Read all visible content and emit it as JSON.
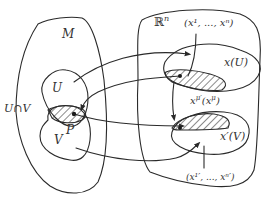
{
  "diagram": {
    "labels": {
      "manifold": "M",
      "chart_u": "U",
      "chart_v": "V",
      "intersection": "U∩V",
      "point": "P",
      "euclidean_space": "ℝ",
      "euclidean_space_exp": "n",
      "coords_top": "(x¹, ..., xⁿ)",
      "image_u": "x(U)",
      "transition": "x",
      "transition_sup": "μ′",
      "transition_arg": "(x",
      "transition_arg_sup": "μ",
      "transition_close": ")",
      "image_v": "x′(V)",
      "coords_bottom": "(x¹′, ..., xⁿ′)"
    },
    "colors": {
      "line": "#2a2a2a",
      "text": "#333333",
      "background": "#ffffff"
    },
    "arrows": [
      {
        "from": "U",
        "to": "x(U)",
        "description": "chart map x: U → x(U)"
      },
      {
        "from": "x(U)",
        "to": "U",
        "description": "inverse map back to U∩V"
      },
      {
        "from": "P",
        "to": "x′(V)",
        "description": "P mapped to x′(V)"
      },
      {
        "from": "V",
        "to": "x′(V)",
        "description": "chart map x′: V → x′(V)"
      },
      {
        "from": "x(U)",
        "to": "x′(V)",
        "description": "transition map x^μ′(x^μ)"
      }
    ]
  }
}
